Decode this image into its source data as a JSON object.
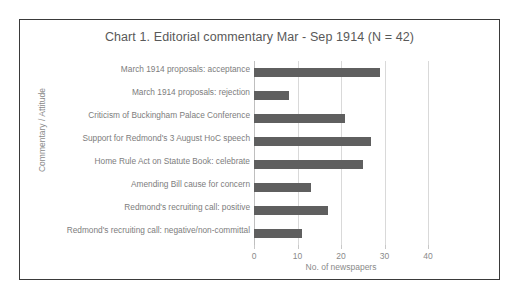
{
  "chart_data": {
    "type": "bar",
    "orientation": "horizontal",
    "title": "Chart 1. Editorial commentary Mar - Sep 1914 (N = 42)",
    "xlabel": "No. of newspapers",
    "ylabel": "Commentary / Attitude",
    "xlim": [
      0,
      40
    ],
    "xticks": [
      "0",
      "10",
      "20",
      "30",
      "40"
    ],
    "grid": true,
    "legend": null,
    "bar_color": "#5f5f5f",
    "categories": [
      "March 1914 proposals: acceptance",
      "March 1914 proposals: rejection",
      "Criticism of Buckingham Palace Conference",
      "Support for Redmond's 3 August HoC speech",
      "Home Rule Act on Statute Book: celebrate",
      "Amending Bill cause for concern",
      "Redmond's recruiting call: positive",
      "Redmond's recruiting call: negative/non-committal"
    ],
    "values": [
      29,
      8,
      21,
      27,
      25,
      13,
      17,
      11
    ]
  }
}
